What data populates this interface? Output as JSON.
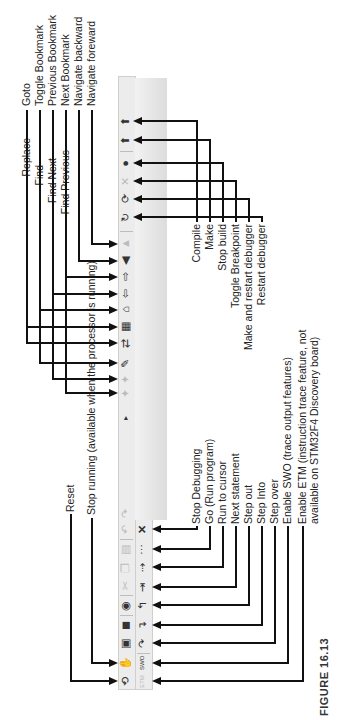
{
  "figure": {
    "caption": "FIGURE 16.13"
  },
  "toolbar": {
    "build_row": [
      {
        "name": "reset-icon",
        "glyph": "⟲",
        "dim": false
      },
      {
        "name": "stop-running-icon",
        "glyph": "✋",
        "dim": true
      },
      {
        "name": "save-icon",
        "glyph": "▣",
        "dim": false
      },
      {
        "name": "save-all-icon",
        "glyph": "◼",
        "dim": false
      },
      {
        "name": "open-icon",
        "glyph": "◉",
        "dim": false
      },
      {
        "name": "cut-icon",
        "glyph": "✂",
        "dim": true
      },
      {
        "name": "copy-icon",
        "glyph": "❐",
        "dim": true
      },
      {
        "name": "paste-icon",
        "glyph": "▤",
        "dim": true
      },
      {
        "name": "undo-icon",
        "glyph": "↶",
        "dim": true
      },
      {
        "name": "redo-icon",
        "glyph": "↷",
        "dim": true
      },
      {
        "name": "find-previous-icon",
        "glyph": "✦",
        "dim": true
      },
      {
        "name": "find-next-icon",
        "glyph": "✦",
        "dim": true
      },
      {
        "name": "find-icon",
        "glyph": "✎",
        "dim": false
      },
      {
        "name": "replace-icon",
        "glyph": "⇄",
        "dim": false
      },
      {
        "name": "goto-icon",
        "glyph": "▦",
        "dim": false
      },
      {
        "name": "toggle-bookmark-icon",
        "glyph": "⌂",
        "dim": false
      },
      {
        "name": "previous-bookmark-icon",
        "glyph": "⇦",
        "dim": false
      },
      {
        "name": "next-bookmark-icon",
        "glyph": "⇨",
        "dim": false
      },
      {
        "name": "navigate-backward-icon",
        "glyph": "◀",
        "dim": false
      },
      {
        "name": "navigate-forward-icon",
        "glyph": "▲",
        "dim": true
      },
      {
        "name": "restart-debugger-icon",
        "glyph": "↻",
        "dim": false
      },
      {
        "name": "make-restart-debugger-icon",
        "glyph": "⟳",
        "dim": false
      },
      {
        "name": "toggle-breakpoint-icon",
        "glyph": "✕",
        "dim": true
      },
      {
        "name": "stop-build-icon",
        "glyph": "●",
        "dim": false
      },
      {
        "name": "make-icon",
        "glyph": "⬆",
        "dim": false
      },
      {
        "name": "compile-icon",
        "glyph": "⬆",
        "dim": false
      }
    ],
    "debug_row": [
      {
        "name": "enable-etm-icon",
        "glyph": "ETM",
        "dim": true
      },
      {
        "name": "enable-swo-icon",
        "glyph": "SWO",
        "dim": false
      },
      {
        "name": "step-over-icon",
        "glyph": "↷",
        "dim": false
      },
      {
        "name": "step-into-icon",
        "glyph": "↴",
        "dim": false
      },
      {
        "name": "step-out-icon",
        "glyph": "↰",
        "dim": false
      },
      {
        "name": "next-statement-icon",
        "glyph": "⇥",
        "dim": false
      },
      {
        "name": "run-to-cursor-icon",
        "glyph": "⇢",
        "dim": false
      },
      {
        "name": "go-icon",
        "glyph": "⋯",
        "dim": false
      },
      {
        "name": "stop-debugging-icon",
        "glyph": "✕",
        "dim": false
      }
    ],
    "overflow_glyph": "▸"
  },
  "labels_top": {
    "reset": "Reset",
    "stop_running": "Stop running (available when the processor is running)",
    "find_previous": "Find Previous",
    "find_next": "Find Next",
    "find": "Find",
    "replace": "Replace",
    "goto": "Goto",
    "toggle_bookmark": "Toggle Bookmark",
    "previous_bookmark": "Previous Bookmark",
    "next_bookmark": "Next Bookmark",
    "navigate_backward": "Navigate backward",
    "navigate_forward": "Navigate foreward"
  },
  "labels_bottom": {
    "stop_debugging": "Stop Debugging",
    "go": "Go (Run program)",
    "run_to_cursor": "Run to cursor",
    "next_statement": "Next statement",
    "step_out": "Step out",
    "step_into": "Step Into",
    "step_over": "Step over",
    "enable_swo": "Enable SWO (trace output features)",
    "enable_etm_1": "Enable ETM (instruction trace feature, not",
    "enable_etm_2": "available on STM32F4 Discovery board)",
    "compile": "Compile",
    "make": "Make",
    "stop_build": "Stop build",
    "toggle_breakpoint": "Toggle Breakpoint",
    "make_restart_debugger": "Make and restart debugger",
    "restart_debugger": "Restart debugger"
  }
}
